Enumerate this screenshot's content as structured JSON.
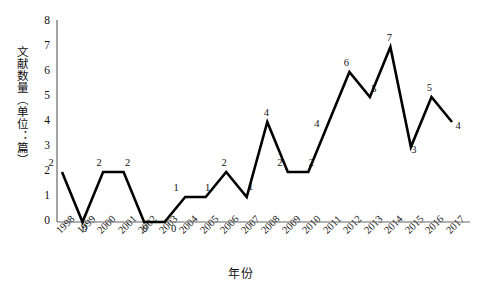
{
  "chart_data": {
    "type": "line",
    "title": "",
    "xlabel": "年份",
    "ylabel": "文献数量（单位：篇）",
    "categories": [
      "1998",
      "1999",
      "2000",
      "2001",
      "2002",
      "2003",
      "2004",
      "2005",
      "2006",
      "2007",
      "2008",
      "2009",
      "2010",
      "2011",
      "2012",
      "2013",
      "2014",
      "2015",
      "2016",
      "2017"
    ],
    "values": [
      2,
      0,
      2,
      2,
      0,
      0,
      1,
      1,
      2,
      1,
      4,
      2,
      2,
      4,
      6,
      5,
      7,
      3,
      5,
      4
    ],
    "point_labels": [
      "2",
      "0",
      "2",
      "2",
      "0",
      "0",
      "1",
      "1",
      "2",
      "1",
      "4",
      "2",
      "2",
      "4",
      "6",
      "5",
      "7",
      "3",
      "5",
      "4"
    ],
    "ylim": [
      0,
      8
    ],
    "yticks": [
      "0",
      "1",
      "2",
      "3",
      "4",
      "5",
      "6",
      "7",
      "8"
    ],
    "grid": false,
    "legend": null,
    "series_color": "#000000",
    "axis_color": "#555555"
  },
  "axes": {
    "y_title": "文献数量（单位：篇）",
    "x_title": "年份"
  }
}
